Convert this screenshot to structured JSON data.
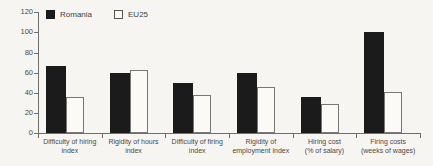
{
  "figure": {
    "background_color": "#f6f5f1",
    "bar_color_romania": "#1b1b1b",
    "bar_color_eu25": "#fbfaf7",
    "bar_border_eu25": "#787878",
    "axis_color": "#6e6e6e",
    "text_color": "#4a4a4a"
  },
  "chart_data": {
    "type": "bar",
    "title": "",
    "xlabel": "",
    "ylabel": "",
    "ylim": [
      0,
      120
    ],
    "y_ticks": [
      "0",
      "20",
      "40",
      "60",
      "80",
      "100",
      "120"
    ],
    "grid": false,
    "legend_position": "top-left",
    "categories": [
      [
        "Difficulty of hiring",
        "index"
      ],
      [
        "Rigidity of hours",
        "index"
      ],
      [
        "Difficulty of firing",
        "index"
      ],
      [
        "Rigidity of",
        "employment index"
      ],
      [
        "Hiring cost",
        "(% of salary)"
      ],
      [
        "Firing costs",
        "(weeks of wages)"
      ]
    ],
    "series": [
      {
        "name": "Romania",
        "style": "filled",
        "values": [
          67,
          60,
          50,
          60,
          36,
          100
        ]
      },
      {
        "name": "EU25",
        "style": "outlined",
        "values": [
          36,
          63,
          38,
          46,
          29,
          41
        ]
      }
    ]
  }
}
